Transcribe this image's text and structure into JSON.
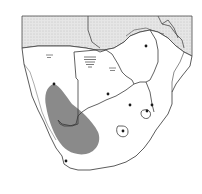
{
  "map": {
    "region": "Southern Africa",
    "colors": {
      "background": "#ffffff",
      "land": "#ffffff",
      "northern_countries": "#e4e4e4",
      "border": "#4a4a4a",
      "range": "#8c8c8c",
      "point": "#1a1a1a",
      "hatch": "#6a6a6a"
    },
    "distribution_range": {
      "label": "species-range",
      "shape": "elongated-blob-west"
    },
    "points": [
      {
        "name": "point-north-namibia",
        "x": 54,
        "y": 83
      },
      {
        "name": "point-zimbabwe",
        "x": 146,
        "y": 46
      },
      {
        "name": "point-botswana",
        "x": 108,
        "y": 94
      },
      {
        "name": "point-transvaal",
        "x": 130,
        "y": 105
      },
      {
        "name": "point-swaziland",
        "x": 147,
        "y": 111
      },
      {
        "name": "point-mozambique-coast",
        "x": 152,
        "y": 106
      },
      {
        "name": "point-lesotho",
        "x": 123,
        "y": 131
      },
      {
        "name": "point-cape",
        "x": 66,
        "y": 161
      }
    ],
    "hatched_marks": [
      {
        "name": "hatch-namibia-north",
        "x": 49,
        "y": 56
      },
      {
        "name": "hatch-botswana-large",
        "x": 90,
        "y": 62
      },
      {
        "name": "hatch-botswana-small",
        "x": 112,
        "y": 69
      }
    ]
  }
}
